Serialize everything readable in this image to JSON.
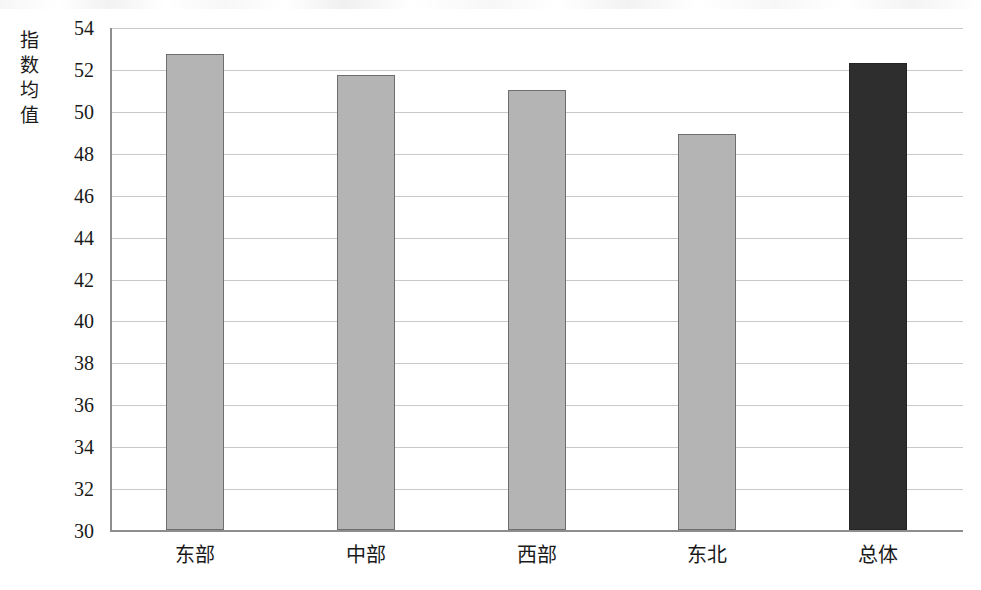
{
  "chart_data": {
    "type": "bar",
    "title": "",
    "subtitle": "",
    "xlabel": "",
    "ylabel": "指数均值",
    "categories": [
      "东部",
      "中部",
      "西部",
      "东北",
      "总体"
    ],
    "values": [
      52.7,
      51.7,
      51.0,
      48.9,
      52.3
    ],
    "series": [
      {
        "name": "指数均值",
        "values": [
          52.7,
          51.7,
          51.0,
          48.9,
          52.3
        ]
      }
    ],
    "ylim": [
      30,
      54
    ],
    "ytick_step": 2,
    "ytick_labels": [
      "54",
      "52",
      "50",
      "48",
      "46",
      "44",
      "42",
      "40",
      "38",
      "36",
      "34",
      "32",
      "30"
    ],
    "ytick_values": [
      54,
      52,
      50,
      48,
      46,
      44,
      42,
      40,
      38,
      36,
      34,
      32,
      30
    ],
    "grid": true,
    "grid_axis": "y",
    "legend": false,
    "legend_position": "none",
    "annotations": [],
    "bar_colors": [
      "#b4b4b4",
      "#b4b4b4",
      "#b4b4b4",
      "#b4b4b4",
      "#2e2e2e"
    ],
    "bar_edge_color": "#6e6e6e",
    "highlight_category": "总体",
    "colors": {
      "bar_region": "#b4b4b4",
      "bar_total": "#2e2e2e",
      "gridline": "#c9c9c9",
      "axis": "#8d8d8d",
      "text": "#1a1a1a",
      "background": "#ffffff"
    }
  }
}
